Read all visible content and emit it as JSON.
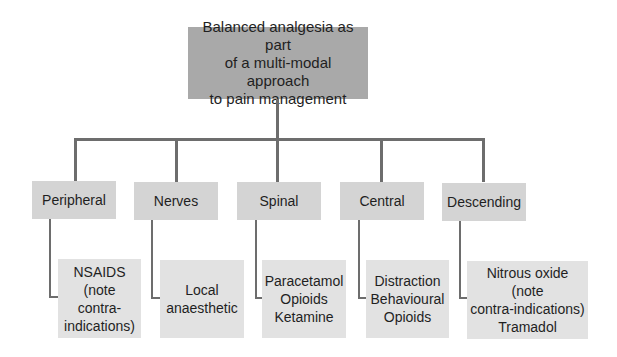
{
  "root": {
    "lines": [
      "Balanced analgesia as part",
      "of a multi-modal approach",
      "to pain management"
    ]
  },
  "categories": [
    {
      "label": "Peripheral",
      "details": [
        "NSAIDS",
        "(note",
        "contra-",
        "indications)"
      ]
    },
    {
      "label": "Nerves",
      "details": [
        "Local",
        "anaesthetic"
      ]
    },
    {
      "label": "Spinal",
      "details": [
        "Paracetamol",
        "Opioids",
        "Ketamine"
      ]
    },
    {
      "label": "Central",
      "details": [
        "Distraction",
        "Behavioural",
        "Opioids"
      ]
    },
    {
      "label": "Descending",
      "details": [
        "Nitrous oxide",
        "(note",
        "contra-indications)",
        "Tramadol"
      ]
    }
  ],
  "colors": {
    "root_box": "#a9a9a9",
    "category_box": "#d4d4d4",
    "detail_box": "#e2e2e2",
    "connector": "#6d6d6d"
  }
}
